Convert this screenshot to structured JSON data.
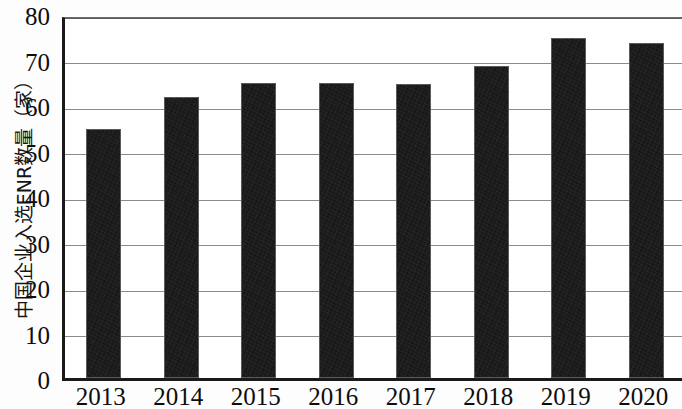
{
  "chart_data": {
    "type": "bar",
    "title": "",
    "subtitle": "",
    "xlabel": "",
    "ylabel": "中国企业入选ENR数量（家）",
    "categories": [
      "2013",
      "2014",
      "2015",
      "2016",
      "2017",
      "2018",
      "2019",
      "2020"
    ],
    "values": [
      54.8,
      61.8,
      64.8,
      64.8,
      64.6,
      68.6,
      74.8,
      73.6
    ],
    "series": [
      {
        "name": "中国企业入选ENR数量（家）",
        "values": [
          54.8,
          61.8,
          64.8,
          64.8,
          64.6,
          68.6,
          74.8,
          73.6
        ]
      }
    ],
    "ylim": [
      0,
      80
    ],
    "ytick_values": [
      0,
      10,
      20,
      30,
      40,
      50,
      60,
      70,
      80
    ],
    "ytick_labels": [
      "0",
      "10",
      "20",
      "30",
      "40",
      "50",
      "60",
      "70",
      "80"
    ],
    "xtick_labels": [
      "2013",
      "2014",
      "2015",
      "2016",
      "2017",
      "2018",
      "2019",
      "2020"
    ],
    "grid": true,
    "grid_axis": "y",
    "legend": false,
    "legend_position": "none",
    "bar_color": "#141414",
    "grid_color": "#8a8a8a",
    "axis_color": "#1a1a1a",
    "background_color": "#ffffff",
    "annotations": []
  }
}
